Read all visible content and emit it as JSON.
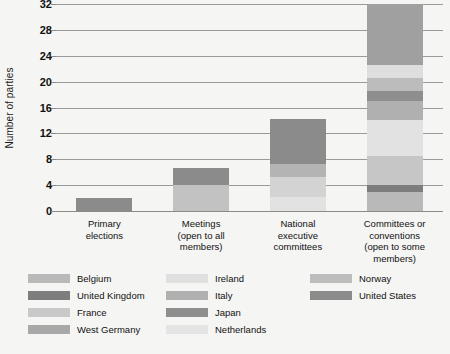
{
  "chart_data": {
    "type": "bar",
    "title": "",
    "subtitle": "",
    "xlabel": "",
    "ylabel": "Number of parties",
    "ylim": [
      0,
      32
    ],
    "ytick_values": [
      0,
      4,
      8,
      12,
      16,
      20,
      24,
      28,
      32
    ],
    "ytick_labels": [
      "0",
      "4",
      "8",
      "12",
      "16",
      "20",
      "24",
      "28",
      "32"
    ],
    "grid": true,
    "grid_axis": "y",
    "legend_position": "bottom",
    "stacked": true,
    "categories": [
      "Primary elections",
      "Meetings (open to all members)",
      "National executive committees",
      "Committees or conventions (open to some members)"
    ],
    "category_lines": [
      [
        "Primary",
        "elections"
      ],
      [
        "Meetings",
        "(open to all",
        "members)"
      ],
      [
        "National",
        "executive",
        "committees"
      ],
      [
        "Committees or",
        "conventions",
        "(open to some",
        "members)"
      ]
    ],
    "totals": [
      2,
      6.7,
      14.3,
      32
    ],
    "series": [
      {
        "name": "Belgium",
        "color": "#b9b9b9",
        "values": [
          0,
          0,
          0,
          3
        ]
      },
      {
        "name": "United Kingdom",
        "color": "#7d7d7d",
        "values": [
          0,
          0,
          0,
          1
        ]
      },
      {
        "name": "France",
        "color": "#c9c9c9",
        "values": [
          0,
          5,
          0,
          4.5
        ]
      },
      {
        "name": "West Germany",
        "color": "#a8a8a8",
        "values": [
          0,
          0,
          0,
          0
        ]
      },
      {
        "name": "Ireland",
        "color": "#e0e0e0",
        "values": [
          0,
          0,
          4.3,
          5.5
        ]
      },
      {
        "name": "Italy",
        "color": "#b0b0b0",
        "values": [
          0,
          0,
          2,
          3
        ]
      },
      {
        "name": "Japan",
        "color": "#8e8e8e",
        "values": [
          0,
          0,
          0,
          0
        ]
      },
      {
        "name": "Netherlands",
        "color": "#e4e4e4",
        "values": [
          0,
          0,
          2,
          3.5
        ]
      },
      {
        "name": "Norway",
        "color": "#bdbdbd",
        "values": [
          0,
          0,
          0,
          2
        ]
      },
      {
        "name": "United States",
        "color": "#8b8b8b",
        "values": [
          2,
          1.7,
          6,
          9.5
        ]
      }
    ],
    "bar_stacks": [
      {
        "category": "Primary elections",
        "segments": [
          {
            "name": "United States",
            "value": 2,
            "color": "#8b8b8b"
          }
        ]
      },
      {
        "category": "Meetings (open to all members)",
        "segments": [
          {
            "name": "France",
            "value": 4.0,
            "color": "#c2c2c2"
          },
          {
            "name": "United States",
            "value": 2.7,
            "color": "#8b8b8b"
          }
        ]
      },
      {
        "category": "National executive committees",
        "segments": [
          {
            "name": "Netherlands",
            "value": 2.2,
            "color": "#e2e2e2"
          },
          {
            "name": "Ireland",
            "value": 3.1,
            "color": "#d3d3d3"
          },
          {
            "name": "Italy",
            "value": 2.0,
            "color": "#b4b4b4"
          },
          {
            "name": "United States",
            "value": 7.0,
            "color": "#8b8b8b"
          }
        ]
      },
      {
        "category": "Committees or conventions (open to some members)",
        "segments": [
          {
            "name": "Belgium",
            "value": 3.0,
            "color": "#b9b9b9"
          },
          {
            "name": "United Kingdom",
            "value": 1.0,
            "color": "#7d7d7d"
          },
          {
            "name": "France",
            "value": 4.5,
            "color": "#c6c6c6"
          },
          {
            "name": "Ireland",
            "value": 5.5,
            "color": "#e2e2e2"
          },
          {
            "name": "Italy",
            "value": 3.0,
            "color": "#b0b0b0"
          },
          {
            "name": "Japan",
            "value": 1.5,
            "color": "#8e8e8e"
          },
          {
            "name": "Netherlands",
            "value": 2.0,
            "color": "#bcbcbc"
          },
          {
            "name": "Norway",
            "value": 2.0,
            "color": "#dedede"
          },
          {
            "name": "United States",
            "value": 9.5,
            "color": "#a0a0a0"
          }
        ]
      }
    ]
  },
  "legend": {
    "columns": [
      [
        {
          "label": "Belgium",
          "color": "#b9b9b9"
        },
        {
          "label": "United Kingdom",
          "color": "#7d7d7d"
        },
        {
          "label": "France",
          "color": "#c9c9c9"
        },
        {
          "label": "West Germany",
          "color": "#a8a8a8"
        }
      ],
      [
        {
          "label": "Ireland",
          "color": "#e0e0e0"
        },
        {
          "label": "Italy",
          "color": "#b0b0b0"
        },
        {
          "label": "Japan",
          "color": "#8e8e8e"
        },
        {
          "label": "Netherlands",
          "color": "#e4e4e4"
        }
      ],
      [
        {
          "label": "Norway",
          "color": "#bdbdbd"
        },
        {
          "label": "United States",
          "color": "#8b8b8b"
        }
      ]
    ]
  },
  "colors": {
    "background": "#f5f5f3",
    "gridline": "#9a9a98",
    "text": "#111111"
  }
}
